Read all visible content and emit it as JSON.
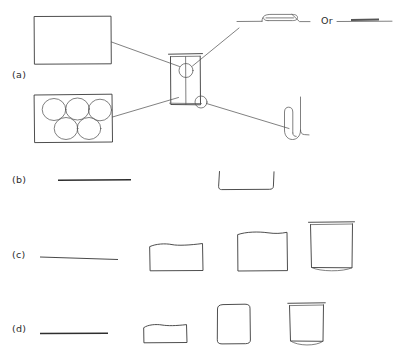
{
  "figure": {
    "width": 395,
    "height": 362,
    "background_color": "#ffffff",
    "ink_color": "#3a3a3a",
    "rule_color": "#2e2e2e"
  },
  "panels": [
    {
      "id": "a",
      "label": "(a)",
      "label_x": 12,
      "label_y": 78,
      "description": "Central vessel with four leader lines to detail callouts"
    },
    {
      "id": "b",
      "label": "(b)",
      "label_x": 12,
      "label_y": 183,
      "description": "Flat rule and open-top channel profile"
    },
    {
      "id": "c",
      "label": "(c)",
      "label_x": 12,
      "label_y": 258,
      "description": "Progression from flat line to tall open vessel"
    },
    {
      "id": "d",
      "label": "(d)",
      "label_x": 12,
      "label_y": 332,
      "description": "Progression from flat line to tall narrow vessel"
    }
  ],
  "panel_a": {
    "plain_plate": {
      "name": "blank-rectangular-plate",
      "x": 34,
      "y": 16,
      "width": 77,
      "height": 48
    },
    "well_plate": {
      "name": "five-well-plate",
      "x": 34,
      "y": 94,
      "width": 78,
      "height": 48,
      "well_count": 5,
      "top_row_wells": 3,
      "bottom_row_wells": 2,
      "well_radius": 11.5
    },
    "central_vessel": {
      "name": "central-vessel",
      "x": 170,
      "y": 53,
      "width": 31,
      "height": 52,
      "upper_node_label": "",
      "lower_node_label": "",
      "upper_node_radius": 7,
      "lower_node_radius": 6
    },
    "callout_folded_strip": {
      "name": "folded-strip-detail",
      "baseline_y": 20,
      "x_start": 237,
      "x_end": 310
    },
    "or_text": "Or",
    "callout_plain_strip": {
      "name": "plain-strip-detail",
      "baseline_y": 20,
      "x_start": 337,
      "x_end": 392
    },
    "callout_u_tube": {
      "name": "u-tube-detail",
      "x": 292,
      "y": 97,
      "height": 42
    },
    "leader_lines": 4
  },
  "panel_b": {
    "flat_rule": {
      "name": "flat-rule-b",
      "x1": 58,
      "y1": 180,
      "x2": 131,
      "y2": 180
    },
    "channel": {
      "name": "open-channel-profile",
      "x": 218,
      "y": 172,
      "width": 56,
      "height": 17
    }
  },
  "panel_c": {
    "stages": [
      {
        "name": "stage-flat-line",
        "type": "line",
        "x": 40,
        "y": 258,
        "width": 78,
        "height": 0
      },
      {
        "name": "stage-short-box",
        "type": "box",
        "x": 149,
        "y": 243,
        "width": 54,
        "height": 28
      },
      {
        "name": "stage-square-box",
        "type": "box",
        "x": 237,
        "y": 232,
        "width": 50,
        "height": 39
      },
      {
        "name": "stage-tall-vessel",
        "type": "vessel",
        "x": 309,
        "y": 222,
        "width": 44,
        "height": 49
      }
    ]
  },
  "panel_d": {
    "stages": [
      {
        "name": "stage-flat-line",
        "type": "line",
        "x": 40,
        "y": 333,
        "width": 68,
        "height": 0
      },
      {
        "name": "stage-short-box",
        "type": "box",
        "x": 143,
        "y": 323,
        "width": 44,
        "height": 19
      },
      {
        "name": "stage-tall-box",
        "type": "box",
        "x": 216,
        "y": 305,
        "width": 34,
        "height": 38
      },
      {
        "name": "stage-tall-vessel",
        "type": "vessel",
        "x": 288,
        "y": 303,
        "width": 36,
        "height": 41
      }
    ]
  }
}
